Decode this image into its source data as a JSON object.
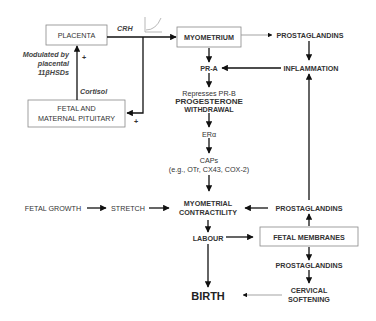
{
  "nodes": {
    "placenta": "PLACENTA",
    "myometrium": "MYOMETRIUM",
    "prostaglandins_top": "PROSTAGLANDINS",
    "pituitary_line1": "FETAL AND",
    "pituitary_line2": "MATERNAL PITUITARY",
    "pra": "PR-A",
    "inflammation": "INFLAMMATION",
    "represses_line1": "Represses PR-B",
    "represses_line2": "PROGESTERONE",
    "represses_line3": "WITHDRAWAL",
    "era": "ERα",
    "caps_line1": "CAPs",
    "caps_line2": "(e.g., OTr, CX43, COX-2)",
    "fetal_growth": "FETAL GROWTH",
    "stretch": "STRETCH",
    "contractility_line1": "MYOMETRIAL",
    "contractility_line2": "CONTRACTILITY",
    "prostaglandins_mid": "PROSTAGLANDINS",
    "labour": "LABOUR",
    "fetal_membranes": "FETAL MEMBRANES",
    "prostaglandins_low": "PROSTAGLANDINS",
    "birth": "BIRTH",
    "cervical_line1": "CERVICAL",
    "cervical_line2": "SOFTENING"
  },
  "labels": {
    "crh": "CRH",
    "cortisol": "Cortisol",
    "modulated_line1": "Modulated by",
    "modulated_line2": "placental",
    "modulated_line3": "11βHSDs",
    "plus_top": "+",
    "plus_bottom": "+"
  },
  "icons": {
    "crh_curve": "exponential-curve-icon"
  },
  "colors": {
    "line": "#111111",
    "box_border": "#888888",
    "text": "#333333"
  }
}
